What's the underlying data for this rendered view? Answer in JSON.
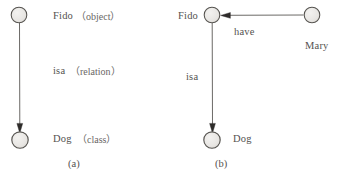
{
  "figure": {
    "colors": {
      "node_fill": "#e8e6e3",
      "node_stroke": "#5a5855",
      "edge": "#5a5855",
      "text": "#555250"
    },
    "panels": [
      {
        "id": "a",
        "caption": "(a)",
        "nodes": [
          {
            "id": "fido-a",
            "label": "Fido",
            "qualifier": "（object）",
            "cx": 19,
            "cy": 15,
            "r": 8
          },
          {
            "id": "dog-a",
            "label": "Dog",
            "qualifier": "（class）",
            "cx": 20,
            "cy": 140,
            "r": 8
          }
        ],
        "edges": [
          {
            "id": "isa-a",
            "label": "isa",
            "qualifier": "（relation）",
            "from": "fido-a",
            "to": "dog-a",
            "direction": "down"
          }
        ]
      },
      {
        "id": "b",
        "caption": "(b)",
        "nodes": [
          {
            "id": "fido-b",
            "label": "Fido",
            "qualifier": "",
            "cx": 212,
            "cy": 15,
            "r": 8
          },
          {
            "id": "mary-b",
            "label": "Mary",
            "qualifier": "",
            "cx": 312,
            "cy": 15,
            "r": 8
          },
          {
            "id": "dog-b",
            "label": "Dog",
            "qualifier": "",
            "cx": 212,
            "cy": 140,
            "r": 8
          }
        ],
        "edges": [
          {
            "id": "have-b",
            "label": "have",
            "qualifier": "",
            "from": "mary-b",
            "to": "fido-b",
            "direction": "left"
          },
          {
            "id": "isa-b",
            "label": "isa",
            "qualifier": "",
            "from": "fido-b",
            "to": "dog-b",
            "direction": "down"
          }
        ]
      }
    ],
    "text": {
      "fido_a": "Fido",
      "fido_a_qual": "（object）",
      "isa_a": "isa",
      "isa_a_qual": "（relation）",
      "dog_a": "Dog",
      "dog_a_qual": "（class）",
      "caption_a": "(a)",
      "fido_b": "Fido",
      "mary_b": "Mary",
      "have_b": "have",
      "isa_b": "isa",
      "dog_b": "Dog",
      "caption_b": "(b)"
    }
  }
}
